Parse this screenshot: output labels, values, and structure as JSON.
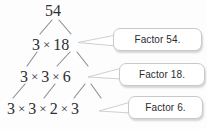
{
  "diagram": {
    "type": "factor-tree",
    "background_color": "#fdfdfd",
    "text_color": "#2e2e33",
    "branch_color": "#8b8b93",
    "callout_border_color": "#c9c9cd",
    "callout_fill_color": "#ffffff",
    "multiplication_sign": "×",
    "levels": [
      {
        "id": "level-0",
        "terms": [
          "54"
        ]
      },
      {
        "id": "level-1",
        "terms": [
          "3",
          "18"
        ]
      },
      {
        "id": "level-2",
        "terms": [
          "3",
          "3",
          "6"
        ]
      },
      {
        "id": "level-3",
        "terms": [
          "3",
          "3",
          "2",
          "3"
        ]
      }
    ],
    "callouts": [
      {
        "id": "callout-factor-54",
        "label": "Factor 54.",
        "points_to": "level-1"
      },
      {
        "id": "callout-factor-18",
        "label": "Factor 18.",
        "points_to": "level-2"
      },
      {
        "id": "callout-factor-6",
        "label": "Factor 6.",
        "points_to": "level-3"
      }
    ]
  }
}
